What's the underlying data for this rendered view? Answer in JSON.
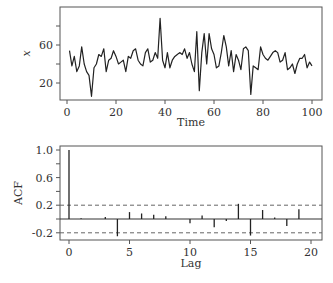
{
  "chart_data": [
    {
      "type": "line",
      "title": "",
      "xlabel": "Time",
      "ylabel": "x",
      "xlim": [
        0,
        100
      ],
      "ylim": [
        3,
        90
      ],
      "xticks": [
        0,
        20,
        40,
        60,
        80,
        100
      ],
      "yticks": [
        20,
        40,
        60,
        80
      ],
      "ytick_labels": [
        "20",
        "",
        "60",
        ""
      ],
      "grid": false,
      "x": [
        1,
        2,
        3,
        4,
        5,
        6,
        7,
        8,
        9,
        10,
        11,
        12,
        13,
        14,
        15,
        16,
        17,
        18,
        19,
        20,
        21,
        22,
        23,
        24,
        25,
        26,
        27,
        28,
        29,
        30,
        31,
        32,
        33,
        34,
        35,
        36,
        37,
        38,
        39,
        40,
        41,
        42,
        43,
        44,
        45,
        46,
        47,
        48,
        49,
        50,
        51,
        52,
        53,
        54,
        55,
        56,
        57,
        58,
        59,
        60,
        61,
        62,
        63,
        64,
        65,
        66,
        67,
        68,
        69,
        70,
        71,
        72,
        73,
        74,
        75,
        76,
        77,
        78,
        79,
        80,
        81,
        82,
        83,
        84,
        85,
        86,
        87,
        88,
        89,
        90,
        91,
        92,
        93,
        94,
        95,
        96,
        97,
        98,
        99,
        100
      ],
      "values": [
        54,
        38,
        48,
        32,
        38,
        58,
        40,
        32,
        28,
        6,
        36,
        40,
        50,
        48,
        56,
        32,
        44,
        46,
        54,
        48,
        40,
        42,
        44,
        32,
        48,
        46,
        54,
        56,
        44,
        40,
        38,
        52,
        56,
        42,
        44,
        52,
        46,
        88,
        44,
        36,
        52,
        36,
        44,
        48,
        50,
        52,
        50,
        56,
        46,
        52,
        40,
        32,
        74,
        12,
        52,
        72,
        40,
        72,
        56,
        50,
        36,
        38,
        52,
        70,
        58,
        38,
        54,
        32,
        50,
        44,
        34,
        56,
        58,
        54,
        8,
        38,
        36,
        34,
        58,
        50,
        46,
        44,
        48,
        52,
        54,
        52,
        42,
        44,
        52,
        34,
        36,
        40,
        30,
        40,
        46,
        46,
        50,
        36,
        42,
        38
      ]
    },
    {
      "type": "bar",
      "title": "",
      "xlabel": "Lag",
      "ylabel": "ACF",
      "xlim": [
        -0.5,
        20.8
      ],
      "ylim": [
        -0.3,
        1.05
      ],
      "xticks": [
        0,
        5,
        10,
        15,
        20
      ],
      "yticks": [
        1.0,
        0.8,
        0.6,
        0.4,
        0.2,
        0.0,
        -0.2
      ],
      "ytick_labels": [
        "1.0",
        "",
        "0.6",
        "",
        "0.2",
        "",
        "-0.2"
      ],
      "confidence_bounds": [
        0.2,
        -0.2
      ],
      "grid": false,
      "categories": [
        0,
        1,
        2,
        3,
        4,
        5,
        6,
        7,
        8,
        9,
        10,
        11,
        12,
        13,
        14,
        15,
        16,
        17,
        18,
        19,
        20
      ],
      "values": [
        1.0,
        0.01,
        0.0,
        0.03,
        -0.25,
        0.1,
        0.08,
        0.06,
        0.04,
        0.0,
        -0.06,
        0.05,
        -0.12,
        -0.03,
        0.22,
        -0.24,
        0.13,
        0.02,
        -0.1,
        0.14,
        0.0
      ]
    }
  ]
}
